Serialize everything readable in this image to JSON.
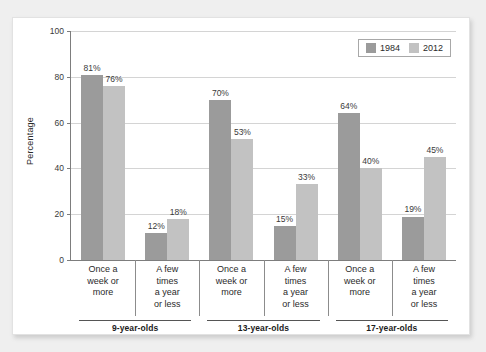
{
  "chart_data": {
    "type": "bar",
    "title": "",
    "subtitle": "",
    "xlabel": "",
    "ylabel": "Percentage",
    "ylim": [
      0,
      100
    ],
    "yticks": [
      0,
      20,
      40,
      60,
      80,
      100
    ],
    "ytick_labels": [
      "0",
      "20",
      "40",
      "60",
      "80",
      "100"
    ],
    "grid": true,
    "legend_position": "top-right",
    "legend": [
      "1984",
      "2012"
    ],
    "value_suffix": "%",
    "groups": [
      {
        "label": "9-year-olds",
        "categories": [
          {
            "label": "Once a\nweek or\nmore",
            "values": [
              81,
              76
            ],
            "value_labels": [
              "81%",
              "76%"
            ]
          },
          {
            "label": "A few\ntimes\na year\nor less",
            "values": [
              12,
              18
            ],
            "value_labels": [
              "12%",
              "18%"
            ]
          }
        ]
      },
      {
        "label": "13-year-olds",
        "categories": [
          {
            "label": "Once a\nweek or\nmore",
            "values": [
              70,
              53
            ],
            "value_labels": [
              "70%",
              "53%"
            ]
          },
          {
            "label": "A few\ntimes\na year\nor less",
            "values": [
              15,
              33
            ],
            "value_labels": [
              "15%",
              "33%"
            ]
          }
        ]
      },
      {
        "label": "17-year-olds",
        "categories": [
          {
            "label": "Once a\nweek or\nmore",
            "values": [
              64,
              40
            ],
            "value_labels": [
              "64%",
              "40%"
            ]
          },
          {
            "label": "A few\ntimes\na year\nor less",
            "values": [
              19,
              45
            ],
            "value_labels": [
              "19%",
              "45%"
            ]
          }
        ]
      }
    ],
    "series": [
      {
        "name": "1984",
        "color": "#9b9b9b",
        "values": [
          81,
          12,
          70,
          15,
          64,
          19
        ]
      },
      {
        "name": "2012",
        "color": "#c2c2c2",
        "values": [
          76,
          18,
          53,
          33,
          40,
          45
        ]
      }
    ],
    "categories": [
      "9-year-olds / Once a week or more",
      "9-year-olds / A few times a year or less",
      "13-year-olds / Once a week or more",
      "13-year-olds / A few times a year or less",
      "17-year-olds / Once a week or more",
      "17-year-olds / A few times a year or less"
    ]
  },
  "colors": {
    "series_1984": "#9b9b9b",
    "series_2012": "#c2c2c2",
    "panel_background": "#ffffff",
    "page_background": "#efefef",
    "gridline": "#d4d4d4",
    "axis": "#7d7d7d",
    "text": "#2a2a2a"
  }
}
